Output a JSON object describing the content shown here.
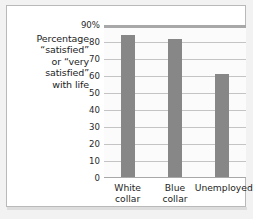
{
  "figure": {
    "caption_lines": [
      "Percentage",
      "“satisfied”",
      "or “very",
      "satisfied”",
      "with life"
    ]
  },
  "chart_data": {
    "type": "bar",
    "title": "",
    "xlabel": "",
    "ylabel": "Percentage “satisfied” or “very satisfied” with life",
    "categories": [
      "White collar",
      "Blue collar",
      "Unemployed"
    ],
    "category_lines": [
      [
        "White",
        "collar"
      ],
      [
        "Blue",
        "collar"
      ],
      [
        "Unemployed"
      ]
    ],
    "values": [
      84,
      82,
      61
    ],
    "ylim": [
      0,
      90
    ],
    "yticks": [
      0,
      10,
      20,
      30,
      40,
      50,
      60,
      70,
      80,
      90
    ],
    "ytick_labels": [
      "0",
      "10",
      "20",
      "30",
      "40",
      "50",
      "60",
      "70",
      "80",
      "90%"
    ],
    "grid": true,
    "legend": "none",
    "bar_color": "#878787",
    "grid_color": "#c4c4c4",
    "axis_color": "#a8a8a8",
    "plot_background": "#fbfbfb"
  }
}
